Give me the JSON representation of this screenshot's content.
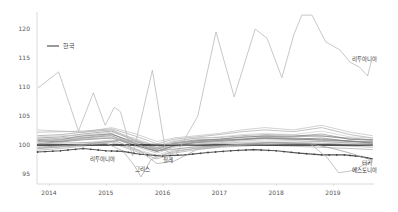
{
  "chart_data": {
    "type": "line",
    "title": "",
    "xlabel": "",
    "ylabel": "",
    "ylim": [
      93.5,
      122.5
    ],
    "xlim": [
      2013.8,
      2019.75
    ],
    "grid": false,
    "legend": {
      "position": "upper-left",
      "entries": [
        {
          "label": "한국",
          "style": "dark line"
        }
      ]
    },
    "x_ticks": [
      2014,
      2015,
      2016,
      2017,
      2018,
      2019
    ],
    "x_tick_labels": [
      "2014",
      "2015",
      "2016",
      "2017",
      "2018",
      "2019"
    ],
    "y_ticks": [
      95,
      100,
      105,
      110,
      115,
      120
    ],
    "y_tick_labels": [
      "95",
      "100",
      "105",
      "110",
      "115",
      "120"
    ],
    "reference_line": {
      "y": 100,
      "color": "#222222"
    },
    "annotations": [
      {
        "text": "리투아니아",
        "x": 2019.55,
        "y": 114.5
      },
      {
        "text": "리투아니아",
        "x": 2014.95,
        "y": 97.2
      },
      {
        "text": "그리스",
        "x": 2015.65,
        "y": 95.5
      },
      {
        "text": "칠레",
        "x": 2016.1,
        "y": 97.0
      },
      {
        "text": "터키",
        "x": 2019.6,
        "y": 96.6
      },
      {
        "text": "에스토니아",
        "x": 2019.55,
        "y": 95.3
      }
    ],
    "highlighted_series": [
      {
        "name": "리투아니아",
        "color": "#b5b5b5",
        "x": [
          2013.8,
          2014.17,
          2014.52,
          2014.78,
          2014.99,
          2015.15,
          2015.26,
          2015.47,
          2015.82,
          2016.05,
          2016.22,
          2016.62,
          2016.94,
          2017.26,
          2017.63,
          2017.84,
          2018.1,
          2018.31,
          2018.45,
          2018.63,
          2018.87,
          2019.12,
          2019.3,
          2019.47,
          2019.61,
          2019.67
        ],
        "values": [
          109.8,
          112.6,
          102.4,
          109.0,
          103.4,
          106.5,
          105.7,
          98.1,
          112.9,
          99.1,
          98.1,
          105.0,
          119.5,
          108.3,
          120.0,
          118.4,
          111.6,
          119.0,
          122.4,
          122.4,
          117.8,
          116.4,
          114.3,
          113.4,
          111.9,
          114.3
        ]
      },
      {
        "name": "한국",
        "color": "#555555",
        "marker": "dot",
        "x": [
          2013.8,
          2014.2,
          2014.6,
          2015.0,
          2015.3,
          2015.6,
          2016.0,
          2016.4,
          2016.8,
          2017.2,
          2017.6,
          2018.0,
          2018.4,
          2018.8,
          2019.2,
          2019.5,
          2019.7
        ],
        "values": [
          98.8,
          99.0,
          99.4,
          99.0,
          98.9,
          98.4,
          98.1,
          98.3,
          98.7,
          99.0,
          99.2,
          99.0,
          98.6,
          98.3,
          98.3,
          98.0,
          97.6
        ]
      },
      {
        "name": "그리스",
        "color": "#aaaaaa",
        "x": [
          2013.8,
          2014.4,
          2015.0,
          2015.3,
          2015.5,
          2015.62,
          2015.8,
          2016.2,
          2016.8,
          2017.5,
          2018.2,
          2018.8,
          2019.4,
          2019.7
        ],
        "values": [
          99.4,
          99.8,
          100.3,
          99.0,
          96.5,
          94.5,
          97.5,
          99.0,
          99.6,
          100.0,
          100.2,
          100.3,
          100.1,
          100.0
        ]
      },
      {
        "name": "칠레",
        "color": "#aaaaaa",
        "x": [
          2013.8,
          2014.5,
          2015.2,
          2015.6,
          2015.9,
          2016.2,
          2016.6,
          2017.2,
          2018.0,
          2018.8,
          2019.4,
          2019.7
        ],
        "values": [
          100.2,
          100.4,
          100.6,
          99.0,
          96.8,
          97.2,
          99.2,
          100.0,
          100.4,
          100.6,
          100.3,
          100.2
        ]
      },
      {
        "name": "에스토니아",
        "color": "#b0b0b0",
        "x": [
          2013.8,
          2014.5,
          2015.2,
          2015.8,
          2016.4,
          2017.0,
          2017.8,
          2018.6,
          2018.9,
          2019.1,
          2019.35,
          2019.55,
          2019.7
        ],
        "values": [
          100.6,
          101.0,
          101.2,
          100.2,
          100.0,
          100.3,
          100.4,
          100.2,
          97.8,
          95.2,
          95.6,
          96.6,
          97.1
        ]
      },
      {
        "name": "터키",
        "color": "#9a9a9a",
        "x": [
          2013.8,
          2014.6,
          2015.3,
          2015.9,
          2016.5,
          2017.2,
          2017.9,
          2018.6,
          2019.0,
          2019.3,
          2019.55,
          2019.7
        ],
        "values": [
          99.6,
          100.1,
          100.9,
          99.0,
          99.6,
          100.0,
          100.4,
          100.2,
          99.4,
          98.6,
          97.8,
          97.4
        ]
      }
    ],
    "background_series": [
      {
        "name": "OECD-1",
        "values": [
          101.6,
          101.8,
          102.2,
          102.6,
          101.0,
          99.6,
          100.6,
          101.2,
          101.3,
          101.6,
          101.8,
          101.7,
          101.5,
          101.2,
          100.9
        ]
      },
      {
        "name": "OECD-2",
        "values": [
          100.9,
          101.2,
          101.5,
          102.0,
          100.3,
          99.0,
          100.0,
          100.6,
          100.8,
          101.0,
          101.4,
          101.2,
          101.0,
          100.7,
          100.5
        ]
      },
      {
        "name": "OECD-3",
        "values": [
          100.4,
          100.7,
          101.0,
          101.4,
          99.8,
          98.6,
          99.6,
          100.2,
          100.4,
          100.7,
          100.9,
          100.8,
          100.6,
          100.4,
          100.2
        ]
      },
      {
        "name": "OECD-4",
        "values": [
          101.2,
          101.4,
          101.9,
          102.4,
          100.8,
          99.3,
          100.4,
          100.9,
          101.0,
          101.3,
          101.6,
          101.5,
          101.9,
          101.0,
          100.8
        ]
      },
      {
        "name": "OECD-5",
        "values": [
          99.8,
          100.0,
          100.3,
          100.9,
          99.4,
          98.2,
          99.2,
          99.8,
          100.2,
          100.5,
          100.6,
          100.5,
          100.3,
          100.0,
          99.8
        ]
      },
      {
        "name": "OECD-6",
        "values": [
          102.2,
          102.3,
          102.4,
          102.8,
          101.6,
          100.2,
          101.0,
          101.4,
          101.8,
          102.3,
          102.6,
          102.3,
          103.0,
          101.8,
          101.2
        ]
      },
      {
        "name": "OECD-7",
        "values": [
          100.2,
          100.6,
          101.2,
          101.6,
          100.0,
          98.9,
          99.9,
          100.5,
          100.8,
          101.0,
          101.1,
          101.0,
          101.2,
          100.6,
          100.4
        ]
      },
      {
        "name": "OECD-8",
        "values": [
          101.0,
          101.0,
          101.3,
          101.8,
          100.6,
          99.5,
          100.3,
          100.8,
          100.9,
          101.0,
          101.3,
          101.1,
          100.8,
          100.6,
          100.6
        ]
      },
      {
        "name": "OECD-9",
        "values": [
          99.4,
          99.7,
          100.0,
          100.6,
          99.2,
          98.0,
          98.8,
          99.5,
          99.9,
          100.2,
          100.4,
          100.3,
          100.0,
          99.8,
          99.6
        ]
      },
      {
        "name": "OECD-10",
        "values": [
          102.6,
          102.4,
          102.2,
          103.0,
          102.0,
          100.6,
          101.2,
          101.6,
          102.0,
          102.6,
          103.0,
          102.6,
          103.4,
          102.2,
          101.6
        ]
      },
      {
        "name": "OECD-11",
        "values": [
          100.6,
          100.9,
          101.6,
          101.9,
          100.4,
          99.2,
          100.2,
          100.7,
          101.0,
          101.4,
          101.5,
          101.4,
          101.6,
          101.0,
          100.9
        ]
      },
      {
        "name": "OECD-12",
        "values": [
          101.4,
          101.6,
          101.7,
          102.2,
          101.2,
          99.8,
          100.8,
          101.1,
          101.4,
          101.8,
          102.0,
          101.8,
          102.4,
          101.4,
          101.2
        ]
      },
      {
        "name": "OECD-13",
        "values": [
          99.1,
          99.4,
          99.8,
          100.4,
          99.0,
          97.6,
          98.6,
          99.2,
          99.6,
          99.8,
          100.0,
          99.8,
          99.6,
          99.4,
          99.2
        ]
      },
      {
        "name": "OECD-14",
        "values": [
          100.8,
          100.5,
          100.9,
          101.2,
          100.0,
          98.9,
          99.8,
          100.4,
          100.6,
          100.9,
          101.2,
          101.0,
          100.9,
          100.7,
          100.3
        ]
      }
    ],
    "background_x": [
      2013.8,
      2014.2,
      2014.6,
      2015.1,
      2015.5,
      2015.9,
      2016.2,
      2016.6,
      2017.0,
      2017.4,
      2017.8,
      2018.3,
      2018.8,
      2019.3,
      2019.7
    ]
  }
}
